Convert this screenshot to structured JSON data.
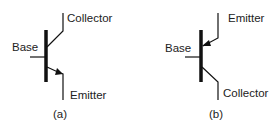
{
  "figures": [
    {
      "id": "a",
      "caption": "(a)",
      "type": "NPN transistor symbol",
      "labels": {
        "base": "Base",
        "collector": "Collector",
        "emitter": "Emitter"
      }
    },
    {
      "id": "b",
      "caption": "(b)",
      "type": "PNP transistor symbol",
      "labels": {
        "base": "Base",
        "emitter": "Emitter",
        "collector": "Collector"
      }
    }
  ],
  "colors": {
    "line": "#111111",
    "text": "#222222",
    "background": "#ffffff"
  }
}
